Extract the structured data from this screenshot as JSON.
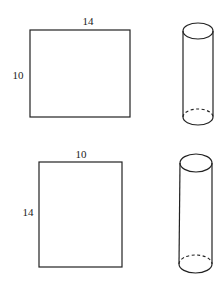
{
  "figures": [
    {
      "rectangle": {
        "top_label": "14",
        "side_label": "10",
        "width": 14,
        "height": 10
      },
      "cylinder": {
        "description": "cylinder formed by rolling rectangle, height 10"
      }
    },
    {
      "rectangle": {
        "top_label": "10",
        "side_label": "14",
        "width": 10,
        "height": 14
      },
      "cylinder": {
        "description": "cylinder formed by rolling rectangle, height 14"
      }
    }
  ]
}
